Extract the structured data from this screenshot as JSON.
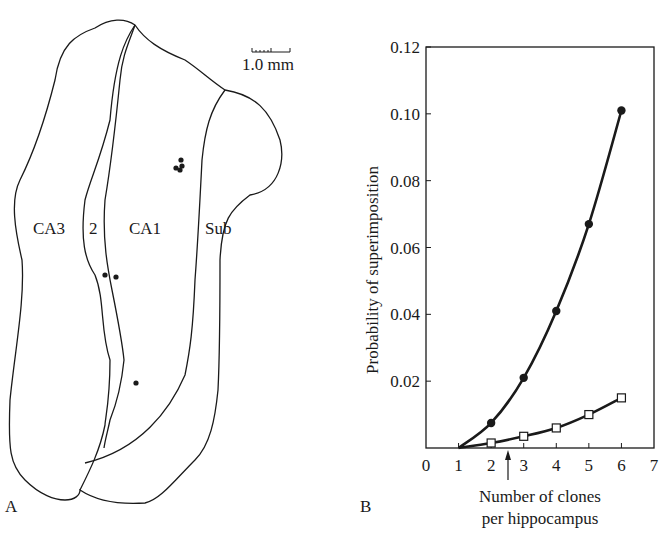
{
  "panel_a": {
    "label": "A",
    "scale_bar_label": "1.0 mm",
    "regions": [
      "CA3",
      "2",
      "CA1",
      "Sub"
    ],
    "dots": [
      {
        "x": 176,
        "y": 168
      },
      {
        "x": 180,
        "y": 170
      },
      {
        "x": 182,
        "y": 166
      },
      {
        "x": 181,
        "y": 160
      },
      {
        "x": 105,
        "y": 275
      },
      {
        "x": 116,
        "y": 277
      },
      {
        "x": 136,
        "y": 383
      }
    ]
  },
  "panel_b": {
    "label": "B"
  },
  "chart_data": {
    "type": "line",
    "title": "",
    "xlabel": "Number of clones per hippocampus",
    "xlabel_lines": [
      "Number of clones",
      "per hippocampus"
    ],
    "ylabel": "Probability of superimposition",
    "xlim": [
      0,
      7
    ],
    "ylim": [
      0,
      0.12
    ],
    "x_ticks": [
      "0",
      "1",
      "2",
      "3",
      "4",
      "5",
      "6",
      "7"
    ],
    "y_ticks": [
      "0.02",
      "0.04",
      "0.06",
      "0.08",
      "0.10",
      "0.12"
    ],
    "grid": false,
    "legend": "none",
    "annotations": [
      {
        "type": "arrow",
        "x": 2.5,
        "direction": "up",
        "position": "below x-axis"
      }
    ],
    "x": [
      1,
      2,
      3,
      4,
      5,
      6
    ],
    "series": [
      {
        "name": "filled circles",
        "marker": "filled-circle",
        "values": [
          0.0,
          0.0075,
          0.021,
          0.041,
          0.067,
          0.101
        ]
      },
      {
        "name": "open squares",
        "marker": "open-square",
        "values": [
          0.0,
          0.0015,
          0.0035,
          0.006,
          0.01,
          0.015
        ]
      }
    ]
  }
}
